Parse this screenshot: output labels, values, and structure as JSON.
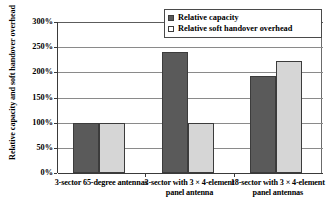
{
  "chart_data": {
    "type": "bar",
    "title": "",
    "subtitle": "",
    "xlabel": "",
    "ylabel": "Relative capacity and soft handover overhead",
    "ylim": [
      0,
      300
    ],
    "ytick_step": 50,
    "grid": true,
    "legend_position": "top-right",
    "categories": [
      "3-sector 65-degree antennas",
      "3-sector with 3 × 4-element panel antenna",
      "18-sector with 3 × 4-element panel antennas"
    ],
    "ytick_labels": [
      "300%",
      "250%",
      "200%",
      "150%",
      "100%",
      "50%",
      "0%"
    ],
    "ytick_values": [
      300,
      250,
      200,
      150,
      100,
      50,
      0
    ],
    "series": [
      {
        "name": "Relative capacity",
        "color": "#5a5a5a",
        "values": [
          100,
          240,
          192
        ]
      },
      {
        "name": "Relative soft handover overhead",
        "color": "#d6d6d6",
        "values": [
          100,
          100,
          222
        ]
      }
    ]
  },
  "legend": {
    "items": [
      {
        "label": "Relative capacity",
        "swatch": "dark-swatch"
      },
      {
        "label": "Relative soft handover overhead",
        "swatch": "light-swatch"
      }
    ]
  },
  "axes": {
    "y_title": "Relative capacity and soft handover overhead",
    "y_ticks": [
      "300%",
      "250%",
      "200%",
      "150%",
      "100%",
      "50%",
      "0%"
    ],
    "x_categories": [
      "3-sector 65-degree antennas",
      "3-sector with 3 × 4-element panel antenna",
      "18-sector with 3 × 4-element panel antennas"
    ]
  }
}
